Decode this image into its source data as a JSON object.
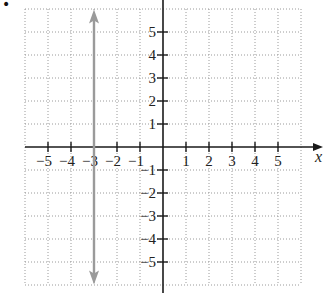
{
  "bullet": "•",
  "chart_data": {
    "type": "line",
    "title": "",
    "xlabel": "x",
    "ylabel": "y",
    "xlim": [
      -6,
      6
    ],
    "ylim": [
      -6,
      6
    ],
    "grid": true,
    "grid_style": "dotted",
    "x_ticks": [
      -5,
      -4,
      -3,
      -2,
      -1,
      1,
      2,
      3,
      4,
      5
    ],
    "y_ticks": [
      -5,
      -4,
      -3,
      -2,
      -1,
      1,
      2,
      3,
      4,
      5
    ],
    "x_tick_labels": [
      "−5",
      "−4",
      "−3",
      "−2",
      "−1",
      "1",
      "2",
      "3",
      "4",
      "5"
    ],
    "y_tick_labels": [
      "−5",
      "−4",
      "−3",
      "−2",
      "−1",
      "1",
      "2",
      "3",
      "4",
      "5"
    ],
    "series": [
      {
        "name": "x = -3",
        "kind": "vertical line with arrows both ends",
        "x": [
          -3,
          -3
        ],
        "y": [
          -5.8,
          5.8
        ],
        "color": "#9a9a9a"
      }
    ]
  },
  "colors": {
    "axis": "#1a1a1a",
    "grid": "#9a9a9a",
    "line": "#9a9a9a"
  }
}
